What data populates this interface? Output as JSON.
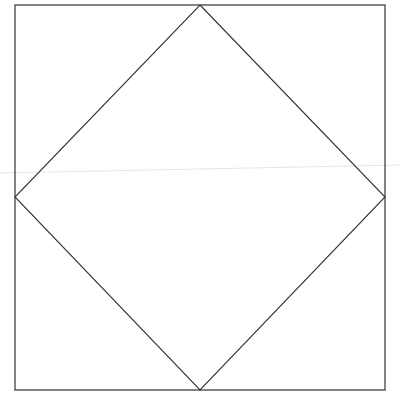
{
  "diagram": {
    "type": "square-with-inscribed-diamond",
    "canvas": {
      "width": 400,
      "height": 402,
      "background": "#ffffff"
    },
    "stroke_color": "#333333",
    "square": {
      "x": 15,
      "y": 5,
      "width": 370,
      "height": 385
    },
    "diamond": {
      "top": [
        200,
        5
      ],
      "right": [
        385,
        197
      ],
      "bottom": [
        200,
        390
      ],
      "left": [
        15,
        197
      ]
    },
    "artifact_line": {
      "x1": 0,
      "y1": 173,
      "x2": 400,
      "y2": 165,
      "color": "#e6e6e6"
    }
  }
}
